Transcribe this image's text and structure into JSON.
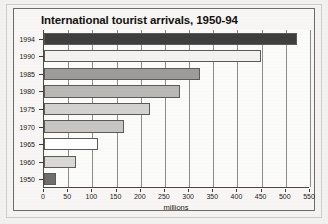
{
  "chart_data": {
    "type": "bar",
    "orientation": "horizontal",
    "title": "International tourist arrivals, 1950-94",
    "xlabel": "millions",
    "ylabel": "",
    "xlim": [
      0,
      550
    ],
    "ylim": null,
    "grid": true,
    "legend": null,
    "categories": [
      "1994",
      "1990",
      "1985",
      "1980",
      "1975",
      "1970",
      "1965",
      "1960",
      "1950"
    ],
    "values": [
      523,
      448,
      322,
      282,
      220,
      166,
      112,
      66,
      25
    ],
    "xticks": [
      "0",
      "50",
      "100",
      "150",
      "200",
      "250",
      "300",
      "350",
      "400",
      "450",
      "500",
      "550"
    ],
    "xtick_values": [
      0,
      50,
      100,
      150,
      200,
      250,
      300,
      350,
      400,
      450,
      500,
      550
    ],
    "bar_colors": [
      "#403f3f",
      "#f3f2f0",
      "#9d9c99",
      "#b9b8b5",
      "#d3d2cf",
      "#c6c5c2",
      "#ffffff",
      "#d9d8d5",
      "#6f6e6b"
    ],
    "bar_border_color": "#5d5b57",
    "gridline_color": "#8e8c88",
    "axis_color": "#4b4945",
    "plot_background": "#fbfbfa",
    "figure_background": "#f7f6f4",
    "page_background": "#f2f1ef",
    "text_color": "#14120f"
  }
}
